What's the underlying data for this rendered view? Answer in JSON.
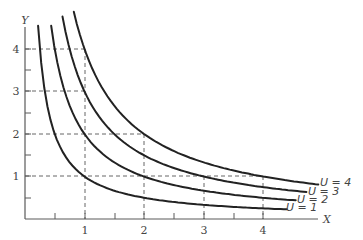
{
  "chart_data": {
    "type": "line",
    "title": "",
    "xlabel": "X",
    "ylabel": "Y",
    "xlim": [
      0,
      4.9
    ],
    "ylim": [
      0,
      4.6
    ],
    "x_ticks": [
      0.5,
      1,
      1.5,
      2,
      2.5,
      3,
      3.5,
      4
    ],
    "x_tick_labels": [
      "",
      "1",
      "",
      "2",
      "",
      "3",
      "",
      "4"
    ],
    "y_ticks": [
      0.5,
      1,
      1.5,
      2,
      2.5,
      3,
      3.5,
      4
    ],
    "y_tick_labels": [
      "",
      "1",
      "",
      "2",
      "",
      "3",
      "",
      "4"
    ],
    "grid": false,
    "legend_position": "inline-right",
    "series": [
      {
        "name": "U = 1",
        "function": "Y = 1/X",
        "x_range": [
          0.22,
          4.4
        ],
        "points": [
          [
            0.25,
            4
          ],
          [
            0.5,
            2
          ],
          [
            1,
            1
          ],
          [
            2,
            0.5
          ],
          [
            4,
            0.25
          ]
        ]
      },
      {
        "name": "U = 2",
        "function": "Y = 2/X",
        "x_range": [
          0.44,
          4.55
        ],
        "points": [
          [
            0.5,
            4
          ],
          [
            1,
            2
          ],
          [
            2,
            1
          ],
          [
            4,
            0.5
          ]
        ]
      },
      {
        "name": "U = 3",
        "function": "Y = 3/X",
        "x_range": [
          0.63,
          4.73
        ],
        "points": [
          [
            0.75,
            4
          ],
          [
            1,
            3
          ],
          [
            1.5,
            2
          ],
          [
            3,
            1
          ],
          [
            4,
            0.75
          ]
        ]
      },
      {
        "name": "U = 4",
        "function": "Y = 4/X",
        "x_range": [
          0.82,
          4.93
        ],
        "points": [
          [
            1,
            4
          ],
          [
            2,
            2
          ],
          [
            4,
            1
          ]
        ]
      }
    ],
    "guides": [
      {
        "type": "h",
        "y": 4,
        "x_from": 0,
        "x_to": 1
      },
      {
        "type": "h",
        "y": 3,
        "x_from": 0,
        "x_to": 1
      },
      {
        "type": "h",
        "y": 2,
        "x_from": 0,
        "x_to": 2
      },
      {
        "type": "h",
        "y": 1,
        "x_from": 0,
        "x_to": 4
      },
      {
        "type": "v",
        "x": 1,
        "y_from": 0,
        "y_to": 4
      },
      {
        "type": "v",
        "x": 2,
        "y_from": 0,
        "y_to": 2
      },
      {
        "type": "v",
        "x": 3,
        "y_from": 0,
        "y_to": 1
      },
      {
        "type": "v",
        "x": 4,
        "y_from": 0,
        "y_to": 1
      }
    ],
    "annotations": [
      "U = 1",
      "U = 2",
      "U = 3",
      "U = 4"
    ]
  },
  "labels": {
    "x_axis": "X",
    "y_axis": "Y",
    "x_ticks": [
      "1",
      "2",
      "3",
      "4"
    ],
    "y_ticks": [
      "1",
      "2",
      "3",
      "4"
    ],
    "curves": [
      "U = 1",
      "U = 2",
      "U = 3",
      "U = 4"
    ]
  }
}
